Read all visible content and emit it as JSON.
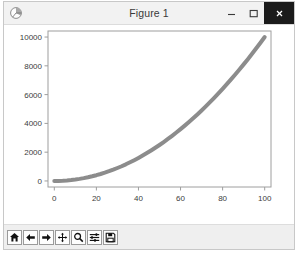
{
  "window": {
    "title": "Figure 1",
    "app_icon": "matplotlib-icon",
    "controls": {
      "minimize": "–",
      "maximize": "☐",
      "close": "✕"
    }
  },
  "toolbar": {
    "buttons": [
      {
        "name": "home-icon",
        "tooltip": "Home"
      },
      {
        "name": "back-arrow-icon",
        "tooltip": "Back"
      },
      {
        "name": "forward-arrow-icon",
        "tooltip": "Forward"
      },
      {
        "name": "pan-move-icon",
        "tooltip": "Pan"
      },
      {
        "name": "zoom-magnifier-icon",
        "tooltip": "Zoom to rectangle"
      },
      {
        "name": "configure-subplots-icon",
        "tooltip": "Configure subplots"
      },
      {
        "name": "save-floppy-icon",
        "tooltip": "Save the figure"
      }
    ]
  },
  "chart_data": {
    "type": "line",
    "title": "",
    "xlabel": "",
    "ylabel": "",
    "xlim": [
      -3,
      103
    ],
    "ylim": [
      -420,
      10420
    ],
    "xticks": [
      0,
      20,
      40,
      60,
      80,
      100
    ],
    "xticklabels": [
      "0",
      "20",
      "40",
      "60",
      "80",
      "100"
    ],
    "yticks": [
      0,
      2000,
      4000,
      6000,
      8000,
      10000
    ],
    "yticklabels": [
      "0",
      "2000",
      "4000",
      "6000",
      "8000",
      "10000"
    ],
    "grid": false,
    "legend": null,
    "line_color": "#8c8c8c",
    "line_width": 4,
    "series": [
      {
        "name": "x squared",
        "x": [
          0,
          2,
          4,
          6,
          8,
          10,
          12,
          14,
          16,
          18,
          20,
          22,
          24,
          26,
          28,
          30,
          32,
          34,
          36,
          38,
          40,
          42,
          44,
          46,
          48,
          50,
          52,
          54,
          56,
          58,
          60,
          62,
          64,
          66,
          68,
          70,
          72,
          74,
          76,
          78,
          80,
          82,
          84,
          86,
          88,
          90,
          92,
          94,
          96,
          98,
          100
        ],
        "values": [
          0,
          4,
          16,
          36,
          64,
          100,
          144,
          196,
          256,
          324,
          400,
          484,
          576,
          676,
          784,
          900,
          1024,
          1156,
          1296,
          1444,
          1600,
          1764,
          1936,
          2116,
          2304,
          2500,
          2704,
          2916,
          3136,
          3364,
          3600,
          3844,
          4096,
          4356,
          4624,
          4900,
          5184,
          5476,
          5776,
          6084,
          6400,
          6724,
          7056,
          7396,
          7744,
          8100,
          8464,
          8836,
          9216,
          9604,
          10000
        ]
      }
    ]
  }
}
